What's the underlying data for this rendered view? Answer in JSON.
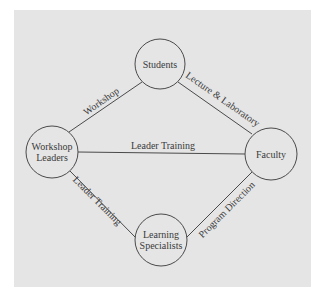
{
  "diagram": {
    "background_color": "#e5e5e5",
    "line_color": "#4a4a4a",
    "text_color": "#3a3a3a",
    "nodes": {
      "students": {
        "label": "Students"
      },
      "workshop_leaders": {
        "line1": "Workshop",
        "line2": "Leaders"
      },
      "faculty": {
        "label": "Faculty"
      },
      "learning_specialists": {
        "line1": "Learning",
        "line2": "Specialists"
      }
    },
    "edges": {
      "workshop_leaders_to_students": "Workshop",
      "students_to_faculty": "Lecture & Laboratory",
      "workshop_leaders_to_faculty": "Leader Training",
      "workshop_leaders_to_learning_specialists": "Leader Training",
      "learning_specialists_to_faculty": "Program Direction"
    }
  }
}
